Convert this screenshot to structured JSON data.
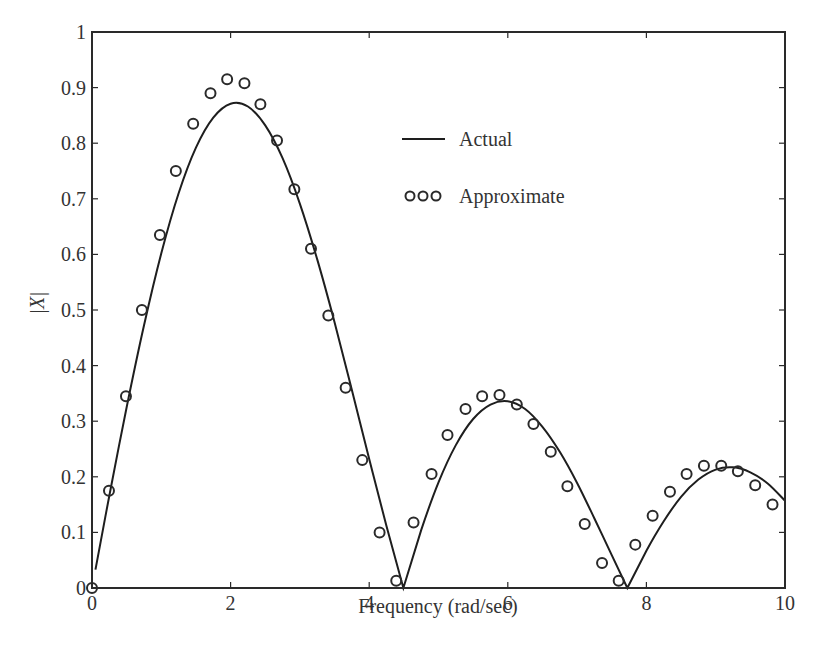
{
  "chart_data": {
    "type": "line",
    "title": "",
    "xlabel": "Frequency (rad/sec)",
    "ylabel": "|X|",
    "xlim": [
      0,
      10
    ],
    "ylim": [
      0,
      1
    ],
    "grid": false,
    "legend_position": "upper center",
    "x_ticks": [
      "0",
      "2",
      "4",
      "6",
      "8",
      "10"
    ],
    "y_ticks": [
      "0",
      "0.1",
      "0.2",
      "0.3",
      "0.4",
      "0.5",
      "0.6",
      "0.7",
      "0.8",
      "0.9",
      "1"
    ],
    "series": [
      {
        "name": "Actual",
        "style": "solid-line",
        "x": [
          0.05,
          0.25,
          0.5,
          0.75,
          1.0,
          1.25,
          1.5,
          1.75,
          2.0,
          2.25,
          2.5,
          2.75,
          3.0,
          3.25,
          3.5,
          3.75,
          4.0,
          4.25,
          4.493,
          4.75,
          5.0,
          5.25,
          5.5,
          5.75,
          6.0,
          6.25,
          6.5,
          6.75,
          7.0,
          7.25,
          7.5,
          7.725,
          8.0,
          8.25,
          8.5,
          8.75,
          9.0,
          9.25,
          9.5,
          9.75,
          10.0
        ],
        "values": [
          0.033,
          0.166,
          0.325,
          0.472,
          0.602,
          0.71,
          0.792,
          0.846,
          0.871,
          0.866,
          0.832,
          0.773,
          0.691,
          0.591,
          0.478,
          0.356,
          0.232,
          0.111,
          0.0,
          0.104,
          0.19,
          0.257,
          0.304,
          0.33,
          0.336,
          0.322,
          0.29,
          0.245,
          0.189,
          0.125,
          0.059,
          0.0,
          0.067,
          0.12,
          0.164,
          0.195,
          0.213,
          0.217,
          0.208,
          0.188,
          0.157
        ]
      },
      {
        "name": "Approximate",
        "style": "open-circle-markers",
        "x": [
          0.0,
          0.245,
          0.49,
          0.72,
          0.98,
          1.21,
          1.46,
          1.71,
          1.95,
          2.2,
          2.43,
          2.67,
          2.92,
          3.16,
          3.41,
          3.66,
          3.9,
          4.15,
          4.39,
          4.64,
          4.9,
          5.13,
          5.39,
          5.63,
          5.88,
          6.13,
          6.37,
          6.62,
          6.86,
          7.11,
          7.36,
          7.6,
          7.84,
          8.09,
          8.34,
          8.58,
          8.83,
          9.08,
          9.32,
          9.57,
          9.82
        ],
        "values": [
          0.0,
          0.175,
          0.345,
          0.5,
          0.635,
          0.75,
          0.835,
          0.89,
          0.915,
          0.908,
          0.87,
          0.805,
          0.717,
          0.61,
          0.49,
          0.36,
          0.23,
          0.1,
          0.013,
          0.118,
          0.205,
          0.275,
          0.322,
          0.345,
          0.347,
          0.33,
          0.295,
          0.245,
          0.183,
          0.115,
          0.045,
          0.013,
          0.078,
          0.13,
          0.173,
          0.205,
          0.22,
          0.22,
          0.21,
          0.185,
          0.15
        ]
      }
    ]
  },
  "legend": {
    "items": [
      {
        "label": "Actual",
        "symbol": "line"
      },
      {
        "label": "Approximate",
        "symbol": "ooo"
      }
    ]
  },
  "axes": {
    "xlabel": "Frequency (rad/sec)",
    "ylabel": "|X|"
  },
  "colors": {
    "line": "#1e1e1e",
    "marker": "#2a2a2a",
    "text": "#333333",
    "background": "#ffffff"
  }
}
